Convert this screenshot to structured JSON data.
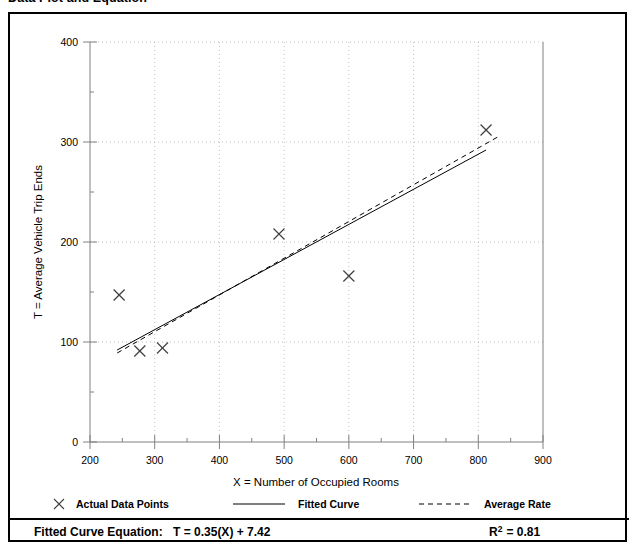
{
  "title": "Data Plot and Equation",
  "legend": {
    "actual_points_label": "Actual Data Points",
    "fitted_curve_label": "Fitted Curve",
    "average_rate_label": "Average Rate",
    "actual_points_marker": "x-marker-icon",
    "fitted_curve_marker": "solid-line-icon",
    "average_rate_marker": "dashed-line-icon"
  },
  "footer": {
    "equation_label": "Fitted Curve Equation:",
    "equation_value": "T = 0.35(X) + 7.42",
    "r2_base": "R",
    "r2_exponent": "2",
    "r2_value": "= 0.81"
  },
  "colors": {
    "axis": "#808080",
    "grid": "#b0b0b0",
    "data": "#404040",
    "frame": "#000000",
    "text": "#000000"
  },
  "chart_data": {
    "type": "scatter",
    "title": "Data Plot and Equation",
    "xlabel": "X = Number of Occupied Rooms",
    "ylabel": "T = Average Vehicle Trip Ends",
    "xlim": [
      200,
      900
    ],
    "ylim": [
      0,
      400
    ],
    "xticks": [
      200,
      300,
      400,
      500,
      600,
      700,
      800,
      900
    ],
    "xtick_labels": [
      "200",
      "300",
      "400",
      "500",
      "600",
      "700",
      "800",
      "900"
    ],
    "yticks": [
      0,
      100,
      200,
      300,
      400
    ],
    "ytick_labels": [
      "0",
      "100",
      "200",
      "300",
      "400"
    ],
    "x_minor_ticks": [
      250,
      350,
      450,
      550,
      650,
      750,
      850
    ],
    "y_minor_ticks": [
      50,
      150,
      250,
      350
    ],
    "grid": true,
    "grid_style": "dotted",
    "legend_position": "below-axes",
    "series": [
      {
        "name": "Actual Data Points",
        "type": "scatter",
        "marker": "x",
        "points": [
          {
            "x": 245,
            "y": 147
          },
          {
            "x": 277,
            "y": 91
          },
          {
            "x": 312,
            "y": 94
          },
          {
            "x": 492,
            "y": 208
          },
          {
            "x": 600,
            "y": 166
          },
          {
            "x": 812,
            "y": 312
          }
        ]
      },
      {
        "name": "Fitted Curve",
        "type": "line",
        "style": "solid",
        "equation": "T = 0.35(X) + 7.42",
        "slope": 0.35,
        "intercept": 7.42,
        "x_start": 242,
        "x_end": 812,
        "y_start": 92,
        "y_end": 292
      },
      {
        "name": "Average Rate",
        "type": "line",
        "style": "dashed",
        "x_start": 242,
        "x_end": 830,
        "y_start": 89,
        "y_end": 305
      }
    ],
    "annotations": [
      {
        "text": "R2 = 0.81",
        "value": 0.81,
        "label": "R-squared"
      }
    ]
  }
}
